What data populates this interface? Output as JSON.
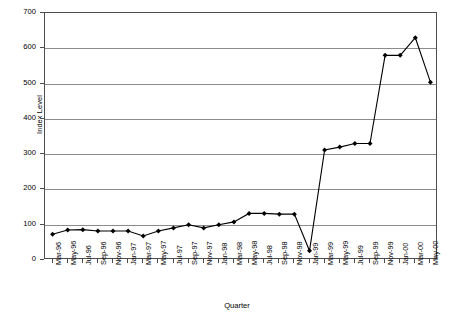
{
  "chart_data": {
    "type": "line",
    "title": "",
    "xlabel": "Quarter",
    "ylabel": "Index Level",
    "ylim": [
      0,
      700
    ],
    "ytick_step": 100,
    "yticks": [
      0,
      100,
      200,
      300,
      400,
      500,
      600,
      700
    ],
    "grid": true,
    "legend": false,
    "marker": "filled-diamond",
    "line_color": "#000000",
    "grid_color": "#8c8c8c",
    "axis_color": "#4d4d4d",
    "categories": [
      "Mar-96",
      "May-96",
      "Jul-96",
      "Sep-96",
      "Nov-96",
      "Jan-97",
      "Mar-97",
      "May-97",
      "Jul-97",
      "Sep-97",
      "Nov-97",
      "Jan-98",
      "Mar-98",
      "May-98",
      "Jul-98",
      "Sep-98",
      "Nov-98",
      "Jan-99",
      "Mar-99",
      "May-99",
      "Jul-99",
      "Sep-99",
      "Nov-99",
      "Jan-00",
      "Mar-00",
      "May-00"
    ],
    "values": [
      73,
      85,
      86,
      82,
      82,
      82,
      68,
      82,
      91,
      100,
      91,
      100,
      108,
      132,
      132,
      130,
      130,
      26,
      312,
      320,
      330,
      330,
      580,
      580,
      630,
      504
    ],
    "xtick_labels": [
      "Mar-96",
      "May-96",
      "Jul-96",
      "Sep-96",
      "Nov-96",
      "Jan-97",
      "Mar-97",
      "May-97",
      "Jul-97",
      "Sep-97",
      "Nov-97",
      "Jan-98",
      "Mar-98",
      "May-98",
      "Jul-98",
      "Sep-98",
      "Nov-98",
      "Jan-99",
      "Mar-99",
      "May-99",
      "Jul-99",
      "Sep-99",
      "Nov-99",
      "Jan-00",
      "Mar-00",
      "May-00"
    ],
    "ytick_labels": [
      "0",
      "100",
      "200",
      "300",
      "400",
      "500",
      "600",
      "700"
    ]
  }
}
